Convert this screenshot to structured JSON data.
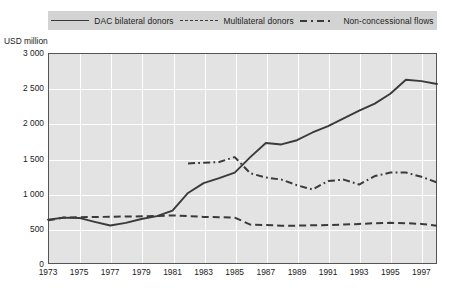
{
  "unit_label": "USD million",
  "legend": {
    "items": [
      {
        "label": "DAC bilateral donors",
        "style": "solid",
        "icon": "solid-line-swatch-icon"
      },
      {
        "label": "Multilateral donors",
        "style": "dashed",
        "icon": "dashed-line-swatch-icon"
      },
      {
        "label": "Non-concessional flows",
        "style": "dash-dot",
        "icon": "dash-dot-line-swatch-icon"
      }
    ]
  },
  "chart_data": {
    "type": "line",
    "title": "",
    "xlabel": "",
    "ylabel": "USD million",
    "xlim": [
      1973,
      1998
    ],
    "ylim": [
      0,
      3000
    ],
    "grid": true,
    "legend_position": "top",
    "y_ticks": [
      "0",
      "500",
      "1 000",
      "1 500",
      "2 000",
      "2 500",
      "3 000"
    ],
    "y_tick_values": [
      0,
      500,
      1000,
      1500,
      2000,
      2500,
      3000
    ],
    "x_ticks": [
      "1973",
      "1975",
      "1977",
      "1979",
      "1981",
      "1983",
      "1985",
      "1987",
      "1989",
      "1991",
      "1993",
      "1995",
      "1997"
    ],
    "x_tick_values": [
      1973,
      1975,
      1977,
      1979,
      1981,
      1983,
      1985,
      1987,
      1989,
      1991,
      1993,
      1995,
      1997
    ],
    "x": [
      1973,
      1974,
      1975,
      1976,
      1977,
      1978,
      1979,
      1980,
      1981,
      1982,
      1983,
      1984,
      1985,
      1986,
      1987,
      1988,
      1989,
      1990,
      1991,
      1992,
      1993,
      1994,
      1995,
      1996,
      1997,
      1998
    ],
    "series": [
      {
        "name": "DAC bilateral donors",
        "style": "solid",
        "x": [
          1973,
          1974,
          1975,
          1976,
          1977,
          1978,
          1979,
          1980,
          1981,
          1982,
          1983,
          1984,
          1985,
          1986,
          1987,
          1988,
          1989,
          1990,
          1991,
          1992,
          1993,
          1994,
          1995,
          1996,
          1997,
          1998
        ],
        "values": [
          630,
          660,
          655,
          600,
          548,
          585,
          640,
          680,
          760,
          1010,
          1150,
          1220,
          1300,
          1520,
          1720,
          1700,
          1760,
          1870,
          1960,
          2070,
          2180,
          2280,
          2420,
          2620,
          2600,
          2560
        ]
      },
      {
        "name": "Multilateral donors",
        "style": "dashed",
        "x": [
          1973,
          1974,
          1975,
          1976,
          1977,
          1978,
          1979,
          1980,
          1981,
          1982,
          1983,
          1984,
          1985,
          1986,
          1987,
          1988,
          1989,
          1990,
          1991,
          1992,
          1993,
          1994,
          1995,
          1996,
          1997,
          1998
        ],
        "values": [
          620,
          660,
          665,
          668,
          672,
          675,
          678,
          682,
          690,
          680,
          670,
          665,
          660,
          560,
          555,
          545,
          545,
          550,
          555,
          560,
          570,
          580,
          585,
          580,
          570,
          545
        ]
      },
      {
        "name": "Non-concessional flows",
        "style": "dash-dot",
        "x": [
          1982,
          1983,
          1984,
          1985,
          1986,
          1987,
          1988,
          1989,
          1990,
          1991,
          1992,
          1993,
          1994,
          1995,
          1996,
          1997,
          1998
        ],
        "values": [
          1430,
          1440,
          1450,
          1520,
          1290,
          1230,
          1200,
          1120,
          1060,
          1180,
          1200,
          1130,
          1250,
          1300,
          1300,
          1240,
          1160
        ]
      }
    ],
    "series_extra_solid": [
      {
        "x": 1994.5,
        "y": 2480
      },
      {
        "x": 1996.2,
        "y": 2630
      },
      {
        "x": 1996.8,
        "y": 2520
      },
      {
        "x": 1997.3,
        "y": 2600
      },
      {
        "x": 1998,
        "y": 2380
      }
    ]
  }
}
